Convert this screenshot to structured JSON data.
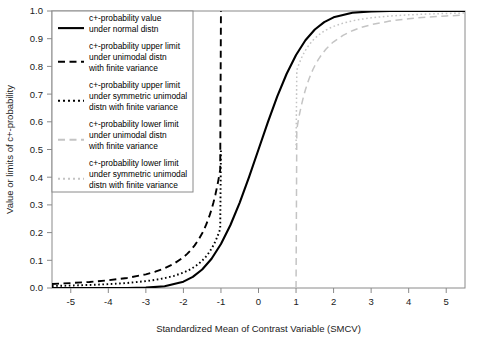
{
  "chart_data": {
    "type": "line",
    "title": "",
    "xlabel": "Standardized Mean of Contrast Variable (SMCV)",
    "ylabel": "Value or limits of c+-probability",
    "xlim": [
      -5.5,
      5.5
    ],
    "ylim": [
      0.0,
      1.0
    ],
    "grid": false,
    "legend_position": "top-left",
    "xticks": [
      "-5",
      "-4",
      "-3",
      "-2",
      "-1",
      "0",
      "1",
      "2",
      "3",
      "4",
      "5"
    ],
    "xtick_values": [
      -5,
      -4,
      -3,
      -2,
      -1,
      0,
      1,
      2,
      3,
      4,
      5
    ],
    "yticks": [
      "0.0",
      "0.1",
      "0.2",
      "0.3",
      "0.4",
      "0.5",
      "0.6",
      "0.7",
      "0.8",
      "0.9",
      "1.0"
    ],
    "ytick_values": [
      0.0,
      0.1,
      0.2,
      0.3,
      0.4,
      0.5,
      0.6,
      0.7,
      0.8,
      0.9,
      1.0
    ],
    "series": [
      {
        "name": "c+-probability value under normal distn",
        "style": "solid",
        "color": "#000000",
        "x": [
          -5.5,
          -5.0,
          -4.5,
          -4.0,
          -3.5,
          -3.0,
          -2.5,
          -2.0,
          -1.75,
          -1.5,
          -1.25,
          -1.0,
          -0.75,
          -0.5,
          -0.25,
          0.0,
          0.25,
          0.5,
          0.75,
          1.0,
          1.25,
          1.5,
          1.75,
          2.0,
          2.5,
          3.0,
          3.5,
          4.0,
          4.5,
          5.0,
          5.5
        ],
        "y": [
          0.0,
          0.0,
          0.0,
          0.0,
          0.0002,
          0.0013,
          0.0062,
          0.0228,
          0.0401,
          0.0668,
          0.1056,
          0.1587,
          0.2266,
          0.3085,
          0.4013,
          0.5,
          0.5987,
          0.6915,
          0.7734,
          0.8413,
          0.8944,
          0.9332,
          0.9599,
          0.9772,
          0.9938,
          0.9987,
          0.9998,
          1.0,
          1.0,
          1.0,
          1.0
        ]
      },
      {
        "name": "c+-probability upper limit under unimodal distn with finite variance",
        "style": "dashed",
        "color": "#000000",
        "x": [
          -5.5,
          -5.0,
          -4.5,
          -4.0,
          -3.5,
          -3.0,
          -2.75,
          -2.5,
          -2.25,
          -2.0,
          -1.9,
          -1.8,
          -1.7,
          -1.6,
          -1.5,
          -1.45,
          -1.4,
          -1.35,
          -1.3,
          -1.25,
          -1.2,
          -1.15,
          -1.1,
          -1.08,
          -1.06,
          -1.04,
          -1.02,
          -1.0
        ],
        "y": [
          0.0147,
          0.0178,
          0.0219,
          0.0278,
          0.0363,
          0.0494,
          0.0588,
          0.0711,
          0.0878,
          0.1111,
          0.1232,
          0.1372,
          0.1538,
          0.1736,
          0.1975,
          0.2113,
          0.2268,
          0.2439,
          0.263,
          0.2844,
          0.3086,
          0.336,
          0.3673,
          0.3812,
          0.3957,
          0.4112,
          0.4273,
          1.0
        ]
      },
      {
        "name": "c+-probability upper limit under symmetric unimodal distn with finite variance",
        "style": "dotted",
        "color": "#000000",
        "x": [
          -5.5,
          -5.0,
          -4.5,
          -4.0,
          -3.5,
          -3.0,
          -2.75,
          -2.5,
          -2.25,
          -2.0,
          -1.9,
          -1.8,
          -1.7,
          -1.6,
          -1.5,
          -1.45,
          -1.4,
          -1.35,
          -1.3,
          -1.25,
          -1.2,
          -1.15,
          -1.1,
          -1.08,
          -1.06,
          -1.04,
          -1.02,
          -1.0
        ],
        "y": [
          0.0073,
          0.0089,
          0.011,
          0.0139,
          0.0181,
          0.0247,
          0.0294,
          0.0356,
          0.0439,
          0.0556,
          0.0616,
          0.0686,
          0.0769,
          0.0868,
          0.0988,
          0.1057,
          0.1134,
          0.1219,
          0.1315,
          0.1422,
          0.1543,
          0.168,
          0.1837,
          0.1906,
          0.1979,
          0.2056,
          0.2136,
          0.5
        ]
      },
      {
        "name": "c+-probability lower limit under unimodal distn with finite variance",
        "style": "dashed",
        "color": "#c4c4c4",
        "x": [
          1.0,
          1.02,
          1.04,
          1.06,
          1.08,
          1.1,
          1.15,
          1.2,
          1.25,
          1.3,
          1.35,
          1.4,
          1.45,
          1.5,
          1.6,
          1.7,
          1.8,
          1.9,
          2.0,
          2.25,
          2.5,
          2.75,
          3.0,
          3.5,
          4.0,
          4.5,
          5.0,
          5.5
        ],
        "y": [
          0.0,
          0.5727,
          0.5888,
          0.6043,
          0.6188,
          0.6327,
          0.664,
          0.6914,
          0.7156,
          0.737,
          0.7561,
          0.7732,
          0.7887,
          0.8025,
          0.8264,
          0.8462,
          0.8628,
          0.8768,
          0.8889,
          0.9122,
          0.9289,
          0.9412,
          0.9506,
          0.9637,
          0.9722,
          0.9781,
          0.9822,
          0.9853
        ]
      },
      {
        "name": "c+-probability lower limit under symmetric unimodal distn with finite variance",
        "style": "dotted",
        "color": "#c4c4c4",
        "x": [
          1.0,
          1.02,
          1.04,
          1.06,
          1.08,
          1.1,
          1.15,
          1.2,
          1.25,
          1.3,
          1.35,
          1.4,
          1.45,
          1.5,
          1.6,
          1.7,
          1.8,
          1.9,
          2.0,
          2.25,
          2.5,
          2.75,
          3.0,
          3.5,
          4.0,
          4.5,
          5.0,
          5.5
        ],
        "y": [
          0.5,
          0.7864,
          0.7944,
          0.8021,
          0.8094,
          0.8163,
          0.832,
          0.8457,
          0.8578,
          0.8685,
          0.8781,
          0.8866,
          0.8943,
          0.9012,
          0.9132,
          0.9231,
          0.9314,
          0.9384,
          0.9444,
          0.9561,
          0.9644,
          0.9706,
          0.9753,
          0.9819,
          0.9861,
          0.989,
          0.9911,
          0.9927
        ]
      }
    ]
  },
  "legend": {
    "entries": [
      {
        "label_lines": [
          "c+-probability value",
          "under normal distn"
        ],
        "style": "solid",
        "color": "#000000"
      },
      {
        "label_lines": [
          "c+-probability upper limit",
          "under unimodal distn",
          "with finite variance"
        ],
        "style": "dashed",
        "color": "#000000"
      },
      {
        "label_lines": [
          "c+-probability upper limit",
          "under symmetric unimodal",
          "distn with finite variance"
        ],
        "style": "dotted",
        "color": "#000000"
      },
      {
        "label_lines": [
          "c+-probability lower limit",
          "under unimodal distn",
          "with finite variance"
        ],
        "style": "dashed",
        "color": "#c4c4c4"
      },
      {
        "label_lines": [
          "c+-probability lower limit",
          "under symmetric unimodal",
          "distn with finite variance"
        ],
        "style": "dotted",
        "color": "#c4c4c4"
      }
    ]
  },
  "colors": {
    "frame": "#8a8a8a",
    "black_series": "#000000",
    "gray_series": "#c4c4c4",
    "text": "#1a1a1a",
    "background": "#ffffff"
  }
}
